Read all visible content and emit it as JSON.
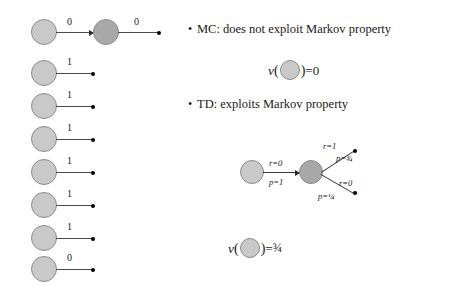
{
  "slide": {
    "background_color": "#ffffff",
    "node_light_color": "#c9c9c9",
    "node_dark_color": "#a8a8a8",
    "node_border_color": "#8c8c8c",
    "edge_color": "#4a4a4a",
    "text_color": "#1a1a1a"
  },
  "left_panel": {
    "name": "episode-chains",
    "rows": [
      {
        "reward_first": "0",
        "reward_second": "0",
        "two_nodes": true
      },
      {
        "reward_first": "1",
        "two_nodes": false
      },
      {
        "reward_first": "1",
        "two_nodes": false
      },
      {
        "reward_first": "1",
        "two_nodes": false
      },
      {
        "reward_first": "1",
        "two_nodes": false
      },
      {
        "reward_first": "1",
        "two_nodes": false
      },
      {
        "reward_first": "1",
        "two_nodes": false
      },
      {
        "reward_first": "0",
        "two_nodes": false
      }
    ]
  },
  "right_panel": {
    "bullets": [
      {
        "marker": "•",
        "text": "MC: does not exploit Markov property"
      },
      {
        "marker": "•",
        "text": "TD: exploits Markov property"
      }
    ],
    "formulas": [
      {
        "name": "mc-value-equation",
        "func": "v",
        "open_paren": "(",
        "close_paren": ")",
        "equals": "=",
        "value": "0"
      },
      {
        "name": "td-value-equation",
        "func": "v",
        "open_paren": "(",
        "close_paren": ")",
        "equals": "=",
        "value": "¾"
      }
    ],
    "td_diagram": {
      "name": "td-branching-diagram",
      "transition_reward": "r=0",
      "transition_prob": "p=1",
      "branch_top_reward": "r=1",
      "branch_top_prob": "p=¾",
      "branch_bottom_reward": "r=0",
      "branch_bottom_prob": "p=¼"
    }
  }
}
